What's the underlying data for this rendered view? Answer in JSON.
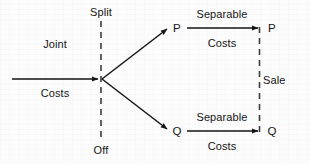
{
  "diagram": {
    "colors": {
      "ink": "#151515",
      "background": "#fcfcfc",
      "dashed_line": "#444444"
    },
    "labels": {
      "joint_top": "Joint",
      "joint_bottom": "Costs",
      "split_top": "Split",
      "split_bottom": "Off",
      "product_p_left": "P",
      "product_p_right": "P",
      "product_q_left": "Q",
      "product_q_right": "Q",
      "separable_top_upper": "Separable",
      "separable_top_lower": "Costs",
      "separable_bottom_upper": "Separable",
      "separable_bottom_lower": "Costs",
      "sale": "Sale"
    },
    "elements": {
      "joint_costs_arrow": "joint-costs-arrow",
      "split_off_line": "split-off-dashed-line",
      "branch_upper": "branch-arrow-to-p",
      "branch_lower": "branch-arrow-to-q",
      "separable_arrow_upper": "separable-costs-arrow-p",
      "separable_arrow_lower": "separable-costs-arrow-q",
      "sale_line": "sale-dashed-line"
    }
  }
}
